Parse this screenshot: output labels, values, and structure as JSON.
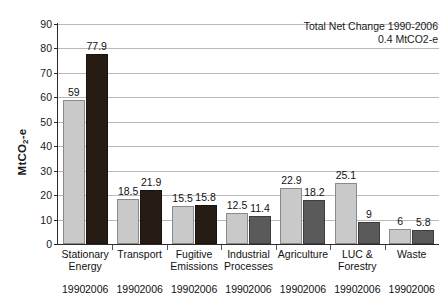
{
  "chart_data": {
    "type": "bar",
    "title": "",
    "xlabel": "",
    "ylabel": "MtCO2-e",
    "ylim": [
      0,
      90
    ],
    "ytick_step": 10,
    "yticks": [
      90,
      80,
      70,
      60,
      50,
      40,
      30,
      20,
      10,
      0
    ],
    "grid": true,
    "legend": "none",
    "categories": [
      "Stationary Energy",
      "Transport",
      "Fugitive Emissions",
      "Industrial Processes",
      "Agriculture",
      "LUC & Forestry",
      "Waste"
    ],
    "category_lines": [
      [
        "Stationary",
        "Energy"
      ],
      [
        "Transport",
        ""
      ],
      [
        "Fugitive",
        "Emissions"
      ],
      [
        "Industrial",
        "Processes"
      ],
      [
        "Agriculture",
        ""
      ],
      [
        "LUC &",
        "Forestry"
      ],
      [
        "Waste",
        ""
      ]
    ],
    "series": [
      {
        "name": "1990",
        "values": [
          59,
          18.5,
          15.5,
          12.5,
          22.9,
          25.1,
          6
        ],
        "labels": [
          "59",
          "18.5",
          "15.5",
          "12.5",
          "22.9",
          "25.1",
          "6"
        ],
        "color": "#c9c9c9"
      },
      {
        "name": "2006",
        "values": [
          77.9,
          21.9,
          15.8,
          11.4,
          18.2,
          9,
          5.8
        ],
        "labels": [
          "77.9",
          "21.9",
          "15.8",
          "11.4",
          "18.2",
          "9",
          "5.8"
        ],
        "colors": [
          "#261c14",
          "#261c14",
          "#261c14",
          "#5a5a5a",
          "#5a5a5a",
          "#5a5a5a",
          "#5a5a5a"
        ]
      }
    ],
    "year_tick_labels": [
      "1990",
      "2006"
    ],
    "annotation": {
      "line1": "Total Net Change 1990-2006",
      "line2": "0.4 MtCO2-e"
    }
  },
  "axis": {
    "y_title_main": "MtCO",
    "y_title_sub": "2",
    "y_title_tail": "-e"
  }
}
